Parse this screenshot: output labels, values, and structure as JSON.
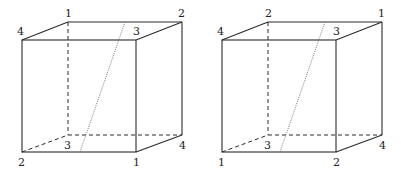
{
  "figure": {
    "cubes": [
      {
        "id": "left-cube",
        "labels": {
          "back_top_left": "1",
          "back_top_right": "2",
          "front_top_left": "4",
          "front_top_right": "3",
          "front_bottom_left": "2",
          "front_bottom_right": "1",
          "back_bottom_left": "3",
          "back_bottom_right": "4"
        }
      },
      {
        "id": "right-cube",
        "labels": {
          "back_top_left": "2",
          "back_top_right": "1",
          "front_top_left": "4",
          "front_top_right": "3",
          "front_bottom_left": "1",
          "front_bottom_right": "2",
          "back_bottom_left": "3",
          "back_bottom_right": "4"
        }
      }
    ],
    "colors": {
      "line": "#2a2a2a",
      "diagonal": "#555555",
      "label": "#222222",
      "background": "#ffffff"
    }
  }
}
